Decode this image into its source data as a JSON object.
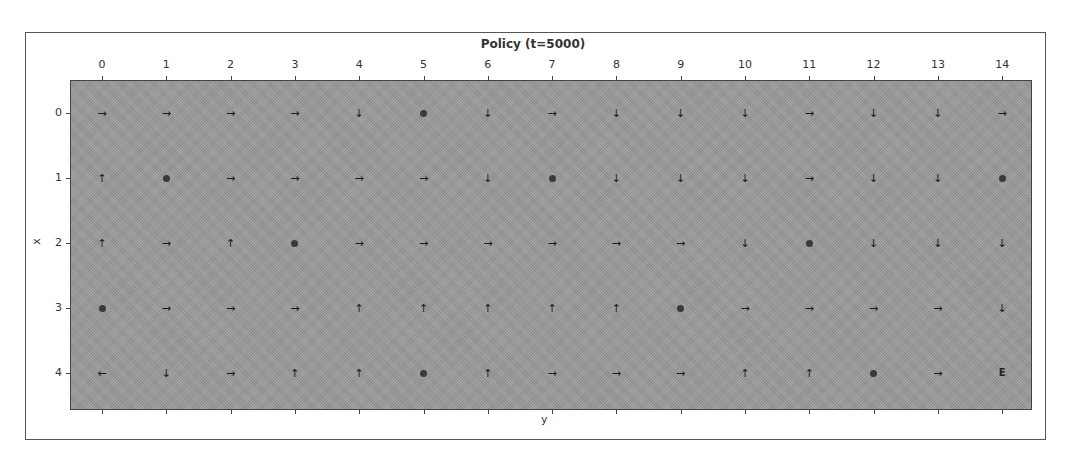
{
  "chart_data": {
    "type": "heatmap",
    "title": "Policy (t=5000)",
    "xlabel": "y",
    "ylabel": "x",
    "x_ticks": [
      "0",
      "1",
      "2",
      "3",
      "4",
      "5",
      "6",
      "7",
      "8",
      "9",
      "10",
      "11",
      "12",
      "13",
      "14"
    ],
    "y_ticks": [
      "0",
      "1",
      "2",
      "3",
      "4"
    ],
    "x_axis_position": "top",
    "grid": false,
    "legend": null,
    "cell_symbols": {
      "right": "→",
      "left": "←",
      "up": "↑",
      "down": "↓",
      "hole": "●",
      "goal": "E"
    },
    "policy_grid": [
      [
        "right",
        "right",
        "right",
        "right",
        "down",
        "hole",
        "down",
        "right",
        "down",
        "down",
        "down",
        "right",
        "down",
        "down",
        "right"
      ],
      [
        "up",
        "hole",
        "right",
        "right",
        "right",
        "right",
        "down",
        "hole",
        "down",
        "down",
        "down",
        "right",
        "down",
        "down",
        "hole"
      ],
      [
        "up",
        "right",
        "up",
        "hole",
        "right",
        "right",
        "right",
        "right",
        "right",
        "right",
        "down",
        "hole",
        "down",
        "down",
        "down"
      ],
      [
        "hole",
        "right",
        "right",
        "right",
        "up",
        "up",
        "up",
        "up",
        "up",
        "hole",
        "right",
        "right",
        "right",
        "right",
        "down"
      ],
      [
        "left",
        "down",
        "right",
        "up",
        "up",
        "hole",
        "up",
        "right",
        "right",
        "right",
        "up",
        "up",
        "hole",
        "right",
        "goal"
      ]
    ],
    "background_color": "#9a9a9a"
  }
}
